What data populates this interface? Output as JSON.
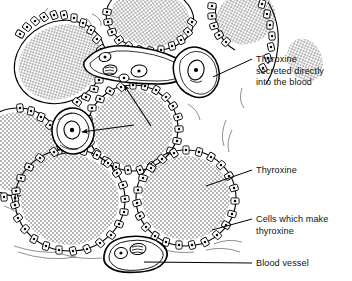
{
  "figure": {
    "background_color": "#ffffff",
    "ink_color": "#000000",
    "stipple_color": "#555555",
    "width": 352,
    "height": 281
  },
  "labels": [
    {
      "id": "thyroxine-secreted",
      "name": "thyroxine-secreted-into-blood-label",
      "lines": [
        "Thyroxine",
        "secreted directly",
        "into the blood"
      ],
      "text_x": 256,
      "text_y": 62,
      "leader": {
        "x1": 252,
        "y1": 59,
        "x2": 213,
        "y2": 77
      }
    },
    {
      "id": "thyroxine",
      "name": "thyroxine-label",
      "lines": [
        "Thyroxine"
      ],
      "text_x": 256,
      "text_y": 173,
      "leader": {
        "x1": 252,
        "y1": 170,
        "x2": 206,
        "y2": 186
      }
    },
    {
      "id": "cells-which-make-thyroxine",
      "name": "cells-which-make-thyroxine-label",
      "lines": [
        "Cells which make",
        "thyroxine"
      ],
      "text_x": 256,
      "text_y": 222,
      "leader": {
        "x1": 252,
        "y1": 219,
        "x2": 212,
        "y2": 230
      }
    },
    {
      "id": "blood-vessel",
      "name": "blood-vessel-label",
      "lines": [
        "Blood vessel"
      ],
      "text_x": 256,
      "text_y": 266,
      "leader": {
        "x1": 252,
        "y1": 263,
        "x2": 144,
        "y2": 262
      }
    }
  ],
  "internal_arrows": [
    {
      "id": "arrow-to-upper-vessel",
      "name": "arrow-to-upper-blood-vessel",
      "x1": 151,
      "y1": 126,
      "x2": 124,
      "y2": 85,
      "description": "arrow from colloid up-left into capillary"
    },
    {
      "id": "arrow-to-left-vessel",
      "name": "arrow-to-left-blood-vessel",
      "x1": 134,
      "y1": 125,
      "x2": 82,
      "y2": 132,
      "description": "arrow from colloid left into capillary cross-section"
    }
  ],
  "follicles": [
    {
      "id": "follicle-top-left",
      "name": "follicle-top-left",
      "cx": 62,
      "cy": 62,
      "rx": 48,
      "ry": 40,
      "rot": -28
    },
    {
      "id": "follicle-left",
      "name": "follicle-left",
      "cx": 26,
      "cy": 150,
      "rx": 40,
      "ry": 42,
      "rot": 10
    },
    {
      "id": "follicle-top-mid",
      "name": "follicle-top-mid",
      "cx": 146,
      "cy": 26,
      "rx": 42,
      "ry": 30,
      "rot": 8
    },
    {
      "id": "follicle-top-right",
      "name": "follicle-top-right",
      "cx": 236,
      "cy": 22,
      "rx": 32,
      "ry": 28,
      "rot": -15
    },
    {
      "id": "follicle-centre",
      "name": "follicle-centre",
      "cx": 133,
      "cy": 128,
      "rx": 46,
      "ry": 44,
      "rot": 0
    },
    {
      "id": "follicle-bottom-left",
      "name": "follicle-bottom-left",
      "cx": 71,
      "cy": 200,
      "rx": 57,
      "ry": 52,
      "rot": 0
    },
    {
      "id": "follicle-bottom-right",
      "name": "follicle-bottom-right",
      "cx": 185,
      "cy": 196,
      "rx": 51,
      "ry": 48,
      "rot": 0
    }
  ],
  "blood_vessels": [
    {
      "id": "vessel-upper-elongated",
      "name": "blood-vessel-upper-elongated",
      "cx": 122,
      "cy": 74,
      "rx": 44,
      "ry": 17,
      "rot": -18
    },
    {
      "id": "vessel-upper-right",
      "name": "blood-vessel-upper-right",
      "cx": 193,
      "cy": 72,
      "rx": 19,
      "ry": 25,
      "rot": 22
    },
    {
      "id": "vessel-left-round",
      "name": "blood-vessel-left-round",
      "cx": 73,
      "cy": 131,
      "rx": 20,
      "ry": 22,
      "rot": -8
    },
    {
      "id": "vessel-bottom",
      "name": "blood-vessel-bottom",
      "cx": 130,
      "cy": 255,
      "rx": 27,
      "ry": 18,
      "rot": -6
    }
  ]
}
